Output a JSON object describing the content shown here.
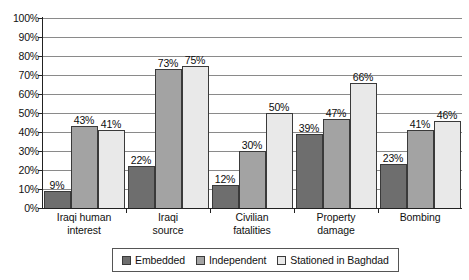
{
  "chart_data": {
    "type": "bar",
    "title": "",
    "subtitle": "",
    "xlabel": "",
    "ylabel": "",
    "ylim": [
      0,
      100
    ],
    "ytick_labels": [
      "100%",
      "90%",
      "80%",
      "70%",
      "60%",
      "50%",
      "40%",
      "30%",
      "20%",
      "10%",
      "0%"
    ],
    "ytick_values": [
      100,
      90,
      80,
      70,
      60,
      50,
      40,
      30,
      20,
      10,
      0
    ],
    "grid": true,
    "legend_position": "bottom",
    "value_labels_suffix": "%",
    "categories": [
      {
        "line1": "Iraqi human",
        "line2": "interest"
      },
      {
        "line1": "Iraqi",
        "line2": "source"
      },
      {
        "line1": "Civilian",
        "line2": "fatalities"
      },
      {
        "line1": "Property",
        "line2": "damage"
      },
      {
        "line1": "Bombing",
        "line2": ""
      }
    ],
    "category_names": [
      "Iraqi human interest",
      "Iraqi source",
      "Civilian fatalities",
      "Property damage",
      "Bombing"
    ],
    "series": [
      {
        "name": "Embedded",
        "color": "#6e6e6e",
        "values": [
          9,
          22,
          12,
          39,
          23
        ],
        "labels": [
          "9%",
          "22%",
          "12%",
          "39%",
          "23%"
        ]
      },
      {
        "name": "Independent",
        "color": "#a3a3a3",
        "values": [
          43,
          73,
          30,
          47,
          41
        ],
        "labels": [
          "43%",
          "73%",
          "30%",
          "47%",
          "41%"
        ]
      },
      {
        "name": "Stationed in Baghdad",
        "color": "#e9e9e9",
        "values": [
          41,
          75,
          50,
          66,
          46
        ],
        "labels": [
          "41%",
          "75%",
          "50%",
          "66%",
          "46%"
        ]
      }
    ]
  }
}
